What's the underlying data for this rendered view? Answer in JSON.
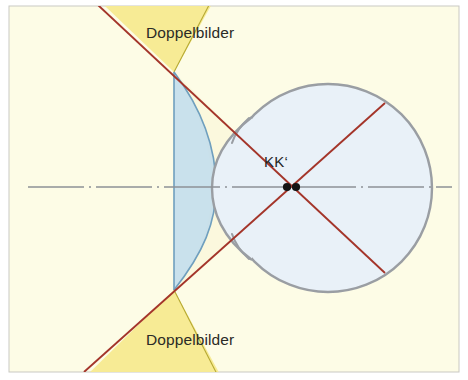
{
  "figure": {
    "name": "optical-diagram-doppelbilder",
    "background_color": "#fdfce6",
    "frame_color": "#c9c9c3",
    "labels": {
      "top_doppelbilder": "Doppelbilder",
      "bottom_doppelbilder": "Doppelbilder",
      "nodal_points": "KK‘"
    },
    "colors": {
      "ray_red": "#a4352a",
      "globe_fill": "#e8f0f7",
      "globe_stroke": "#9a9ea3",
      "lens_fill": "#bfdcec",
      "lens_stroke": "#6f9fbe",
      "wedge_yellow": "#f6e98d",
      "wedge_yellow_edge": "#b5a830",
      "axis_line": "#8d9196",
      "inner_field": "#fbf8de",
      "nodal_dot": "#141414",
      "label_text": "#2b2a26"
    },
    "geometry": {
      "globe": {
        "cx": 328,
        "cy": 188,
        "r": 104
      },
      "cornea_apex_x": 212,
      "lens_left_x": 174,
      "lens_top_y": 72,
      "lens_bottom_y": 290,
      "nodal_point_1_x": 287,
      "nodal_point_2_x": 295,
      "nodal_point_y": 187,
      "optical_axis_y": 187
    }
  }
}
